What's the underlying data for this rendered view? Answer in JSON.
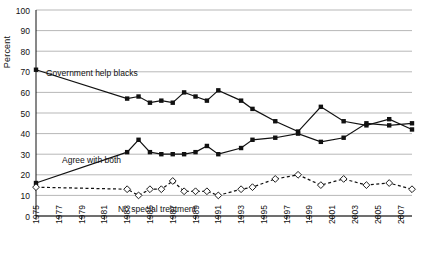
{
  "chart_data": {
    "type": "line",
    "title": "",
    "xlabel": "",
    "ylabel": "Percent",
    "ylim": [
      0,
      100
    ],
    "ytick_step": 10,
    "yticks": [
      "0",
      "10",
      "20",
      "30",
      "40",
      "50",
      "60",
      "70",
      "80",
      "90",
      "100"
    ],
    "grid": "horizontal",
    "legend_position": "inline-annotations",
    "x": [
      1975,
      1976,
      1977,
      1978,
      1979,
      1980,
      1981,
      1982,
      1983,
      1984,
      1985,
      1986,
      1987,
      1988,
      1989,
      1990,
      1991,
      1992,
      1993,
      1994,
      1995,
      1996,
      1997,
      1998,
      1999,
      2000,
      2001,
      2002,
      2003,
      2004,
      2005,
      2006,
      2007,
      2008
    ],
    "xtick_labels": [
      "1975",
      "1977",
      "1979",
      "1981",
      "1983",
      "1985",
      "1987",
      "1989",
      "1991",
      "1993",
      "1995",
      "1997",
      "1999",
      "2001",
      "2003",
      "2005",
      "2007"
    ],
    "series": [
      {
        "name": "Government help blacks",
        "marker": "square",
        "line_style": "solid",
        "color": "#111111",
        "annotation": "Government help blacks",
        "points": [
          {
            "x": 1975,
            "y": 71
          },
          {
            "x": 1983,
            "y": 57
          },
          {
            "x": 1984,
            "y": 58
          },
          {
            "x": 1985,
            "y": 55
          },
          {
            "x": 1986,
            "y": 56
          },
          {
            "x": 1987,
            "y": 55
          },
          {
            "x": 1988,
            "y": 60
          },
          {
            "x": 1989,
            "y": 58
          },
          {
            "x": 1990,
            "y": 56
          },
          {
            "x": 1991,
            "y": 61
          },
          {
            "x": 1993,
            "y": 56
          },
          {
            "x": 1994,
            "y": 52
          },
          {
            "x": 1996,
            "y": 46
          },
          {
            "x": 1998,
            "y": 41
          },
          {
            "x": 2000,
            "y": 53
          },
          {
            "x": 2002,
            "y": 46
          },
          {
            "x": 2004,
            "y": 44
          },
          {
            "x": 2006,
            "y": 47
          },
          {
            "x": 2008,
            "y": 42
          }
        ]
      },
      {
        "name": "Agree with both",
        "marker": "square",
        "line_style": "solid",
        "color": "#111111",
        "annotation": "Agree with both",
        "points": [
          {
            "x": 1975,
            "y": 16
          },
          {
            "x": 1983,
            "y": 31
          },
          {
            "x": 1984,
            "y": 37
          },
          {
            "x": 1985,
            "y": 31
          },
          {
            "x": 1986,
            "y": 30
          },
          {
            "x": 1987,
            "y": 30
          },
          {
            "x": 1988,
            "y": 30
          },
          {
            "x": 1989,
            "y": 31
          },
          {
            "x": 1990,
            "y": 34
          },
          {
            "x": 1991,
            "y": 30
          },
          {
            "x": 1993,
            "y": 33
          },
          {
            "x": 1994,
            "y": 37
          },
          {
            "x": 1996,
            "y": 38
          },
          {
            "x": 1998,
            "y": 40
          },
          {
            "x": 2000,
            "y": 36
          },
          {
            "x": 2002,
            "y": 38
          },
          {
            "x": 2004,
            "y": 45
          },
          {
            "x": 2006,
            "y": 44
          },
          {
            "x": 2008,
            "y": 45
          }
        ]
      },
      {
        "name": "No special treatment",
        "marker": "diamond",
        "line_style": "dashed",
        "color": "#111111",
        "annotation": "No special treatment",
        "points": [
          {
            "x": 1975,
            "y": 14
          },
          {
            "x": 1983,
            "y": 13
          },
          {
            "x": 1984,
            "y": 10
          },
          {
            "x": 1985,
            "y": 13
          },
          {
            "x": 1986,
            "y": 13
          },
          {
            "x": 1987,
            "y": 17
          },
          {
            "x": 1988,
            "y": 12
          },
          {
            "x": 1989,
            "y": 12
          },
          {
            "x": 1990,
            "y": 12
          },
          {
            "x": 1991,
            "y": 10
          },
          {
            "x": 1993,
            "y": 13
          },
          {
            "x": 1994,
            "y": 14
          },
          {
            "x": 1996,
            "y": 18
          },
          {
            "x": 1998,
            "y": 20
          },
          {
            "x": 2000,
            "y": 15
          },
          {
            "x": 2002,
            "y": 18
          },
          {
            "x": 2004,
            "y": 15
          },
          {
            "x": 2006,
            "y": 16
          },
          {
            "x": 2008,
            "y": 13
          }
        ]
      }
    ]
  }
}
